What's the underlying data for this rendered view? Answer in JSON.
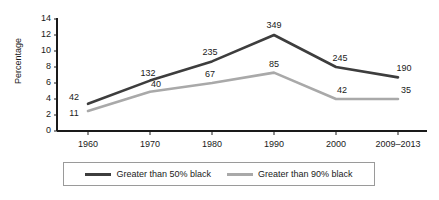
{
  "chart_data": {
    "type": "line",
    "title": "",
    "xlabel": "",
    "ylabel": "Percentage",
    "categories": [
      "1960",
      "1970",
      "1980",
      "1990",
      "2000",
      "2009–2013"
    ],
    "ylim": [
      0,
      14
    ],
    "yticks": [
      0,
      2,
      4,
      6,
      8,
      10,
      12,
      14
    ],
    "grid": false,
    "legend_position": "bottom",
    "series": [
      {
        "name": "Greater than 50% black",
        "color": "#3d3d3d",
        "values": [
          3.4,
          6.3,
          8.7,
          12.0,
          8.0,
          6.7
        ],
        "point_labels": [
          "42",
          "132",
          "235",
          "349",
          "245",
          "190"
        ]
      },
      {
        "name": "Greater than 90% black",
        "color": "#a9a9a9",
        "values": [
          2.5,
          4.9,
          6.0,
          7.3,
          4.0,
          4.0
        ],
        "point_labels": [
          "11",
          "40",
          "67",
          "85",
          "42",
          "35"
        ]
      }
    ]
  },
  "axis": {
    "y_title": "Percentage",
    "y_tick_labels": [
      "14",
      "12",
      "10",
      "8",
      "6",
      "4",
      "2",
      "0"
    ],
    "x_tick_labels": [
      "1960",
      "1970",
      "1980",
      "1990",
      "2000",
      "2009–2013"
    ]
  },
  "legend": {
    "items": [
      {
        "label": "Greater than 50% black",
        "color": "#3d3d3d"
      },
      {
        "label": "Greater than 90% black",
        "color": "#a9a9a9"
      }
    ]
  },
  "colors": {
    "series_dark": "#3d3d3d",
    "series_light": "#a9a9a9",
    "axis": "#1a1a1a",
    "text": "#1a1a1a",
    "background": "#ffffff",
    "legend_border": "#9a9a9a"
  }
}
